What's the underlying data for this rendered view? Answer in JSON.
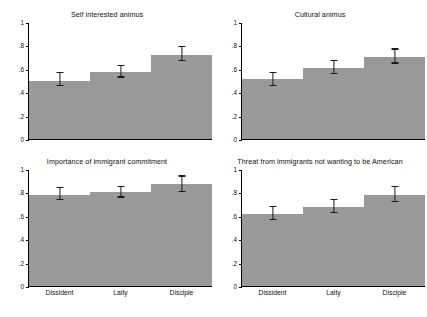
{
  "chart_data": {
    "type": "bar",
    "title": "",
    "categories": [
      "Dissident",
      "Laity",
      "Disciple"
    ],
    "xlabel": "",
    "ylabel": "",
    "ylim": [
      0,
      1
    ],
    "ytick_labels": [
      "0",
      ".2",
      ".4",
      ".6",
      ".8",
      "1"
    ],
    "ytick_values": [
      0,
      0.2,
      0.4,
      0.6,
      0.8,
      1
    ],
    "grid": false,
    "legend": "none",
    "bar_color": "#999999",
    "error_bar_color": "#1a1a1a",
    "error_bars": "95% confidence interval caps",
    "panels": [
      {
        "id": "self-interested-animus",
        "title": "Self interested animus",
        "values": [
          0.5,
          0.57,
          0.72
        ],
        "err_low": [
          0.455,
          0.525,
          0.665
        ],
        "err_high": [
          0.565,
          0.625,
          0.785
        ],
        "show_xlabels": false
      },
      {
        "id": "cultural-animus",
        "title": "Cultural animus",
        "values": [
          0.51,
          0.61,
          0.7
        ],
        "err_low": [
          0.455,
          0.555,
          0.645
        ],
        "err_high": [
          0.565,
          0.665,
          0.765
        ],
        "show_xlabels": false
      },
      {
        "id": "importance-of-immigrant-commitment",
        "title": "Importance of immigrant commitment",
        "values": [
          0.78,
          0.8,
          0.87
        ],
        "err_low": [
          0.735,
          0.755,
          0.805
        ],
        "err_high": [
          0.835,
          0.845,
          0.935
        ],
        "show_xlabels": true
      },
      {
        "id": "threat-from-immigrants-not-wanting-to-be-american",
        "title": "Threat from immigrants not wanting to be American",
        "values": [
          0.615,
          0.675,
          0.775
        ],
        "err_low": [
          0.565,
          0.625,
          0.715
        ],
        "err_high": [
          0.675,
          0.735,
          0.845
        ],
        "show_xlabels": true
      }
    ]
  }
}
